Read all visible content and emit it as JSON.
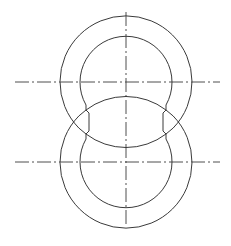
{
  "drawing": {
    "type": "technical line drawing",
    "description": "Two overlapping concentric ring shapes stacked vertically with center lines",
    "stroke_color": "#3a3a3a",
    "background": "#ffffff",
    "centerlines": {
      "vertical": {
        "x": 126,
        "y1": 12,
        "y2": 226
      },
      "horizontal_upper": {
        "y": 82,
        "x1": 15,
        "x2": 220
      },
      "horizontal_lower": {
        "y": 162,
        "x1": 15,
        "x2": 220
      }
    },
    "upper_ring": {
      "cx": 126,
      "cy": 82,
      "outer_r": 66,
      "inner_r": 46
    },
    "lower_ring": {
      "cx": 126,
      "cy": 162,
      "outer_r": 66,
      "inner_r": 46
    }
  }
}
